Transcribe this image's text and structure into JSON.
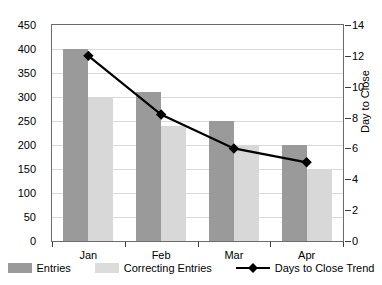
{
  "chart_data": {
    "type": "bar",
    "title": "",
    "xlabel": "",
    "ylabel": "",
    "y2label": "Day to Close",
    "categories": [
      "Jan",
      "Feb",
      "Mar",
      "Apr"
    ],
    "ylim": [
      0,
      450
    ],
    "yticks": [
      0,
      50,
      100,
      150,
      200,
      250,
      300,
      350,
      400,
      450
    ],
    "y2lim": [
      0,
      14
    ],
    "y2ticks": [
      0,
      2,
      4,
      6,
      8,
      10,
      12,
      14
    ],
    "grid": true,
    "legend_position": "bottom",
    "series": [
      {
        "name": "Entries",
        "type": "bar",
        "axis": "left",
        "color": "#9a9a9a",
        "values": [
          400,
          310,
          250,
          200
        ]
      },
      {
        "name": "Correcting Entries",
        "type": "bar",
        "axis": "left",
        "color": "#d8d8d8",
        "values": [
          300,
          240,
          200,
          150
        ]
      },
      {
        "name": "Days to Close Trend",
        "type": "line",
        "axis": "right",
        "color": "#000000",
        "marker": "diamond",
        "values": [
          12,
          8.2,
          6,
          5.1
        ]
      }
    ]
  },
  "legend": {
    "items": [
      {
        "label": "Entries",
        "marker": "bar-swatch-dark"
      },
      {
        "label": "Correcting Entries",
        "marker": "bar-swatch-light"
      },
      {
        "label": "Days to Close Trend",
        "marker": "line-diamond"
      }
    ]
  },
  "colors": {
    "entries": "#9a9a9a",
    "correcting_entries": "#d8d8d8",
    "trend": "#000000",
    "gridline": "#d9d9d9",
    "axis": "#6b6b6b",
    "background": "#ffffff"
  }
}
